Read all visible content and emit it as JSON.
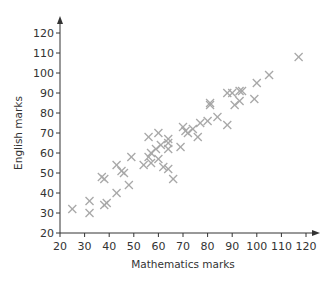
{
  "chart_data": {
    "type": "scatter",
    "title": "",
    "xlabel": "Mathematics marks",
    "ylabel": "English marks",
    "xlim": [
      20,
      120
    ],
    "ylim": [
      20,
      120
    ],
    "x_ticks": [
      20,
      30,
      40,
      50,
      60,
      70,
      80,
      90,
      100,
      110,
      120
    ],
    "y_ticks": [
      20,
      30,
      40,
      50,
      60,
      70,
      80,
      90,
      100,
      110,
      120
    ],
    "grid": false,
    "legend": null,
    "marker": "x",
    "marker_color": "#a8a8a8",
    "axis_color": "#333333",
    "series": [
      {
        "name": "Marks",
        "points": [
          [
            25,
            32
          ],
          [
            32,
            36
          ],
          [
            32,
            30
          ],
          [
            37,
            48
          ],
          [
            38,
            47
          ],
          [
            38,
            34
          ],
          [
            39,
            35
          ],
          [
            43,
            54
          ],
          [
            43,
            40
          ],
          [
            46,
            50
          ],
          [
            45,
            51
          ],
          [
            48,
            44
          ],
          [
            49,
            58
          ],
          [
            54,
            54
          ],
          [
            56,
            58
          ],
          [
            56,
            68
          ],
          [
            57,
            55
          ],
          [
            57,
            60
          ],
          [
            59,
            62
          ],
          [
            60,
            70
          ],
          [
            60,
            57
          ],
          [
            61,
            64
          ],
          [
            62,
            53
          ],
          [
            64,
            67
          ],
          [
            64,
            65
          ],
          [
            64,
            62
          ],
          [
            64,
            52
          ],
          [
            66,
            47
          ],
          [
            69,
            63
          ],
          [
            70,
            73
          ],
          [
            71,
            71
          ],
          [
            72,
            70
          ],
          [
            74,
            72
          ],
          [
            76,
            68
          ],
          [
            77,
            75
          ],
          [
            80,
            76
          ],
          [
            81,
            84
          ],
          [
            81,
            85
          ],
          [
            84,
            78
          ],
          [
            88,
            90
          ],
          [
            88,
            74
          ],
          [
            90,
            90
          ],
          [
            91,
            84
          ],
          [
            93,
            91
          ],
          [
            94,
            91
          ],
          [
            93,
            86
          ],
          [
            99,
            87
          ],
          [
            100,
            95
          ],
          [
            105,
            99
          ],
          [
            117,
            108
          ]
        ]
      }
    ]
  }
}
